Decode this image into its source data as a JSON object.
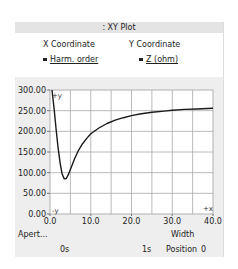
{
  "window": {
    "title": ": XY Plot"
  },
  "legend": {
    "x": {
      "header": "X Coordinate",
      "label": "Harm. order"
    },
    "y": {
      "header": "Y Coordinate",
      "label": "Z (ohm)"
    }
  },
  "axes": {
    "y_marker": "+y",
    "x_marker": "+x",
    "y_bottom_marker": "-y",
    "aperture_label": "Apert...",
    "width_label": "Width",
    "time_start": "0s",
    "time_end": "1s",
    "position_label": "Position",
    "position_value": "0"
  },
  "chart_data": {
    "type": "line",
    "title": "",
    "xlabel": "Harm. order",
    "ylabel": "Z (ohm)",
    "xlim": [
      0,
      40
    ],
    "ylim": [
      0,
      300
    ],
    "x_ticks": [
      "0.0",
      "10.0",
      "20.0",
      "30.0",
      "40.0"
    ],
    "y_ticks": [
      "0.00",
      "50.00",
      "100.00",
      "150.00",
      "200.00",
      "250.00",
      "300.00"
    ],
    "grid": true,
    "legend_position": "top",
    "series": [
      {
        "name": "Z (ohm)",
        "color": "#1a1a1a",
        "x": [
          0.5,
          1,
          1.5,
          2,
          2.5,
          3,
          3.5,
          4,
          4.5,
          5,
          6,
          7,
          8,
          9,
          10,
          12,
          14,
          16,
          18,
          20,
          22,
          25,
          28,
          30,
          33,
          36,
          40
        ],
        "y": [
          300,
          255,
          205,
          160,
          122,
          96,
          85,
          86,
          95,
          108,
          133,
          154,
          170,
          183,
          194,
          208,
          219,
          227,
          233,
          238,
          242,
          246,
          249,
          251,
          253,
          254,
          256
        ]
      }
    ]
  }
}
